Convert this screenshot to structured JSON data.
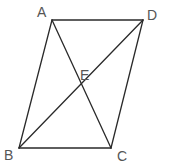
{
  "diagram": {
    "type": "parallelogram-with-diagonals",
    "points": {
      "A": {
        "label": "A",
        "x": 52,
        "y": 20,
        "label_x": 37,
        "label_y": 17
      },
      "D": {
        "label": "D",
        "x": 143,
        "y": 20,
        "label_x": 147,
        "label_y": 20
      },
      "B": {
        "label": "B",
        "x": 19,
        "y": 148,
        "label_x": 4,
        "label_y": 160
      },
      "C": {
        "label": "C",
        "x": 111,
        "y": 148,
        "label_x": 117,
        "label_y": 161
      },
      "E": {
        "label": "E",
        "x": 81,
        "y": 85,
        "label_x": 80,
        "label_y": 80
      }
    },
    "segments": [
      [
        "A",
        "D"
      ],
      [
        "A",
        "B"
      ],
      [
        "B",
        "C"
      ],
      [
        "C",
        "D"
      ],
      [
        "A",
        "C"
      ],
      [
        "B",
        "D"
      ]
    ],
    "colors": {
      "stroke": "#2a2a2a",
      "label": "#555555",
      "background": "#ffffff"
    }
  }
}
